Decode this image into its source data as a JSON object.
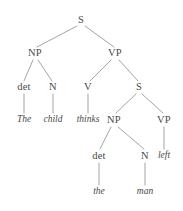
{
  "figure": {
    "name": "syntax-tree-diagram",
    "width": 183,
    "height": 211,
    "background_color": "#ffffff",
    "edge_color": "#9a9a9a",
    "text_color": "#4a4a4a",
    "sentence": "The child thinks the man left"
  },
  "nodes": [
    {
      "id": "s_root",
      "label": "S",
      "kind": "category",
      "x": 81,
      "y": 20
    },
    {
      "id": "np_1",
      "label": "NP",
      "kind": "category",
      "x": 35,
      "y": 53
    },
    {
      "id": "vp_1",
      "label": "VP",
      "kind": "category",
      "x": 115,
      "y": 53
    },
    {
      "id": "det_1",
      "label": "det",
      "kind": "category",
      "x": 24,
      "y": 87
    },
    {
      "id": "n_1",
      "label": "N",
      "kind": "category",
      "x": 53,
      "y": 87
    },
    {
      "id": "v_1",
      "label": "V",
      "kind": "category",
      "x": 88,
      "y": 87
    },
    {
      "id": "s_embedded",
      "label": "S",
      "kind": "category",
      "x": 139,
      "y": 87
    },
    {
      "id": "word_the_1",
      "label": "The",
      "kind": "word",
      "x": 24,
      "y": 120
    },
    {
      "id": "word_child",
      "label": "child",
      "kind": "word",
      "x": 53,
      "y": 120
    },
    {
      "id": "word_thinks",
      "label": "thinks",
      "kind": "word",
      "x": 88,
      "y": 120
    },
    {
      "id": "np_2",
      "label": "NP",
      "kind": "category",
      "x": 114,
      "y": 120
    },
    {
      "id": "vp_2",
      "label": "VP",
      "kind": "category",
      "x": 164,
      "y": 120
    },
    {
      "id": "det_2",
      "label": "det",
      "kind": "category",
      "x": 99,
      "y": 156
    },
    {
      "id": "n_2",
      "label": "N",
      "kind": "category",
      "x": 145,
      "y": 156
    },
    {
      "id": "word_left",
      "label": "left",
      "kind": "word",
      "x": 164,
      "y": 156
    },
    {
      "id": "word_the_2",
      "label": "the",
      "kind": "word",
      "x": 99,
      "y": 192
    },
    {
      "id": "word_man",
      "label": "man",
      "kind": "word",
      "x": 145,
      "y": 192
    }
  ],
  "edges": [
    {
      "from": "s_root",
      "to": "np_1",
      "x1": 77,
      "y1": 26,
      "x2": 37,
      "y2": 47
    },
    {
      "from": "s_root",
      "to": "vp_1",
      "x1": 85,
      "y1": 26,
      "x2": 114,
      "y2": 47
    },
    {
      "from": "np_1",
      "to": "det_1",
      "x1": 33,
      "y1": 60,
      "x2": 24,
      "y2": 81
    },
    {
      "from": "np_1",
      "to": "n_1",
      "x1": 38,
      "y1": 60,
      "x2": 52,
      "y2": 81
    },
    {
      "from": "vp_1",
      "to": "v_1",
      "x1": 111,
      "y1": 60,
      "x2": 90,
      "y2": 81
    },
    {
      "from": "vp_1",
      "to": "s_embedded",
      "x1": 119,
      "y1": 60,
      "x2": 138,
      "y2": 81
    },
    {
      "from": "det_1",
      "to": "word_the_1",
      "x1": 24,
      "y1": 94,
      "x2": 24,
      "y2": 113
    },
    {
      "from": "n_1",
      "to": "word_child",
      "x1": 53,
      "y1": 94,
      "x2": 53,
      "y2": 113
    },
    {
      "from": "v_1",
      "to": "word_thinks",
      "x1": 88,
      "y1": 94,
      "x2": 88,
      "y2": 113
    },
    {
      "from": "s_embedded",
      "to": "np_2",
      "x1": 136,
      "y1": 94,
      "x2": 116,
      "y2": 113
    },
    {
      "from": "s_embedded",
      "to": "vp_2",
      "x1": 142,
      "y1": 94,
      "x2": 163,
      "y2": 113
    },
    {
      "from": "np_2",
      "to": "det_2",
      "x1": 111,
      "y1": 127,
      "x2": 100,
      "y2": 149
    },
    {
      "from": "np_2",
      "to": "n_2",
      "x1": 118,
      "y1": 127,
      "x2": 144,
      "y2": 149
    },
    {
      "from": "vp_2",
      "to": "word_left",
      "x1": 164,
      "y1": 127,
      "x2": 164,
      "y2": 149
    },
    {
      "from": "det_2",
      "to": "word_the_2",
      "x1": 99,
      "y1": 163,
      "x2": 99,
      "y2": 185
    },
    {
      "from": "n_2",
      "to": "word_man",
      "x1": 145,
      "y1": 163,
      "x2": 145,
      "y2": 185
    }
  ]
}
